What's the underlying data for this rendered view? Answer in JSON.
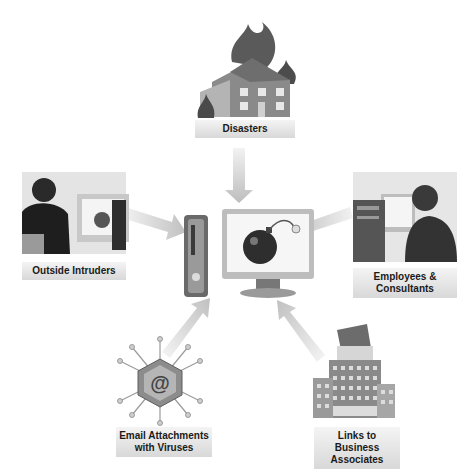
{
  "diagram": {
    "title": "",
    "center": {
      "name": "Computer under threat",
      "icon": "computer-with-bomb-icon"
    },
    "threats": [
      {
        "label": "Disasters",
        "icon": "burning-house-icon",
        "position": "top"
      },
      {
        "label": "Outside Intruders",
        "icon": "intruder-at-computer-icon",
        "position": "left"
      },
      {
        "label": "Employees & Consultants",
        "line1": "Employees &",
        "line2": "Consultants",
        "icon": "employee-at-computer-icon",
        "position": "right"
      },
      {
        "label": "Email Attachments with Viruses",
        "line1": "Email Attachments",
        "line2": "with Viruses",
        "icon": "email-virus-icon",
        "position": "bottom-left"
      },
      {
        "label": "Links to Business Associates",
        "line1": "Links to Business",
        "line2": "Associates",
        "icon": "office-building-icon",
        "position": "bottom-right"
      }
    ],
    "colors": {
      "arrow": "#c8c8c8",
      "label_bg": "#e0e0e0",
      "text": "#1a1a1a"
    }
  }
}
